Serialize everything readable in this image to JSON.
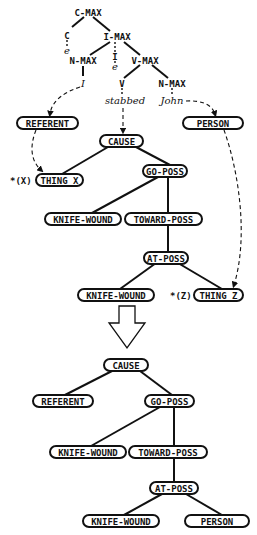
{
  "syntax_tree": {
    "c_max": "C-MAX",
    "c": "C",
    "c_e": "e",
    "i_max": "I-MAX",
    "n_max_subj": "N-MAX",
    "subj_word": "I",
    "i_head": "I",
    "i_e": "e",
    "v_max": "V-MAX",
    "v": "V",
    "verb_word": "stabbed",
    "n_max_obj": "N-MAX",
    "obj_word": "John"
  },
  "lcs_before": {
    "referent": "REFERENT",
    "person": "PERSON",
    "cause": "CAUSE",
    "x_marker": "*(X)",
    "thing_x": "THING X",
    "go_poss": "GO-POSS",
    "knife_wound_1": "KNIFE-WOUND",
    "toward_poss": "TOWARD-POSS",
    "at_poss": "AT-POSS",
    "knife_wound_2": "KNIFE-WOUND",
    "z_marker": "*(Z)",
    "thing_z": "THING Z"
  },
  "transition": {
    "icon": "down-arrow-icon"
  },
  "lcs_after": {
    "cause": "CAUSE",
    "referent": "REFERENT",
    "go_poss": "GO-POSS",
    "knife_wound_1": "KNIFE-WOUND",
    "toward_poss": "TOWARD-POSS",
    "at_poss": "AT-POSS",
    "knife_wound_2": "KNIFE-WOUND",
    "person": "PERSON"
  }
}
